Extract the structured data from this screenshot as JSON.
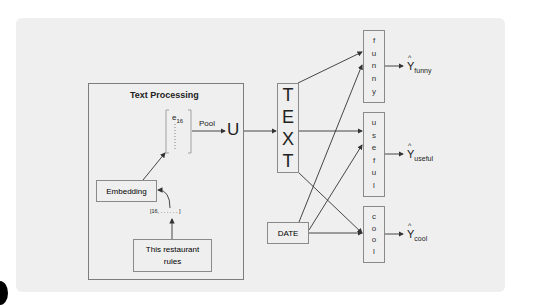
{
  "diagram": {
    "text_processing": {
      "title": "Text Processing",
      "embedding_vector_label": "e",
      "embedding_vector_sub": "16",
      "pool_label": "Pool",
      "pooled_output": "U",
      "embedding_label": "Embedding",
      "token_ids": "[16, . . . . . . ]",
      "input_text": "This restaurant rules"
    },
    "text_node": {
      "letters": [
        "T",
        "E",
        "X",
        "T"
      ]
    },
    "date_node": {
      "label": "DATE"
    },
    "heads": [
      {
        "name": "funny",
        "letters": [
          "f",
          "u",
          "n",
          "n",
          "y"
        ],
        "output": "Y",
        "output_sub": "funny"
      },
      {
        "name": "useful",
        "letters": [
          "u",
          "s",
          "e",
          "f",
          "u",
          "l"
        ],
        "output": "Y",
        "output_sub": "useful"
      },
      {
        "name": "cool",
        "letters": [
          "c",
          "o",
          "o",
          "l"
        ],
        "output": "Y",
        "output_sub": "cool"
      }
    ],
    "hat_symbol": "^",
    "colors": {
      "panel": "#efefef",
      "line": "#333333",
      "box_border": "#8a8a8a"
    }
  }
}
